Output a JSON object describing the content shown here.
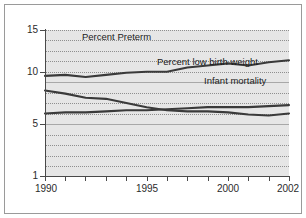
{
  "chart_data": {
    "type": "line",
    "title": "",
    "subtitle": "",
    "xlabel": "",
    "ylabel": "",
    "xlim": [
      1990,
      2002
    ],
    "ylim": [
      1,
      15
    ],
    "grid": true,
    "legend_position": "inline-annotations",
    "x": [
      1990,
      1991,
      1992,
      1993,
      1994,
      1995,
      1996,
      1997,
      1998,
      1999,
      2000,
      2001,
      2002
    ],
    "y_ticks": [
      1,
      5,
      10,
      15
    ],
    "y_tick_labels": [
      "1",
      "5",
      "10",
      "15"
    ],
    "x_ticks": [
      1990,
      1991,
      1992,
      1993,
      1994,
      1995,
      1996,
      1997,
      1998,
      1999,
      2000,
      2001,
      2002
    ],
    "x_tick_labels_shown": [
      "1990",
      "1995",
      "2000",
      "2002"
    ],
    "series": [
      {
        "name": "Percent Preterm",
        "color": "#3a3a3a",
        "values": [
          10.6,
          10.7,
          10.5,
          10.7,
          10.9,
          11.0,
          11.0,
          11.4,
          11.6,
          11.8,
          11.6,
          11.9,
          12.1
        ]
      },
      {
        "name": "Percent low birth weight",
        "color": "#3a3a3a",
        "values": [
          7.0,
          7.1,
          7.1,
          7.2,
          7.3,
          7.3,
          7.4,
          7.5,
          7.6,
          7.6,
          7.6,
          7.7,
          7.8
        ]
      },
      {
        "name": "Infant mortality",
        "color": "#3a3a3a",
        "values": [
          9.2,
          8.9,
          8.5,
          8.4,
          8.0,
          7.6,
          7.3,
          7.2,
          7.2,
          7.1,
          6.9,
          6.8,
          7.0
        ]
      }
    ],
    "annotations": [
      {
        "text": "Percent Preterm",
        "x_px": 77,
        "y_px": 26
      },
      {
        "text": "Percent low birth weight",
        "x_px": 152,
        "y_px": 51
      },
      {
        "text": "Infant mortality",
        "x_px": 199,
        "y_px": 70
      }
    ]
  },
  "axes": {
    "y_labels": [
      "15",
      "10",
      "5",
      "1"
    ],
    "x_labels": [
      "1990",
      "1995",
      "2000",
      "2002"
    ]
  }
}
